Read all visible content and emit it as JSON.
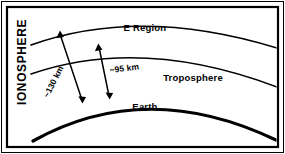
{
  "figure": {
    "background_color": "#ffffff",
    "stroke_color": "#000000",
    "frame": {
      "outer_border_label": "outer-frame",
      "inner_border_label": "inner-frame"
    }
  },
  "labels": {
    "ionosphere": "IONOSPHERE",
    "e_region": "E Region",
    "troposphere": "Troposphere",
    "earth": "Earth"
  },
  "dimensions": {
    "upper": "~130 km",
    "lower": "~95 km"
  },
  "curves": [
    {
      "name": "e-region-top-boundary",
      "thickness": "thin"
    },
    {
      "name": "e-region-bottom-boundary",
      "thickness": "thin"
    },
    {
      "name": "earth-surface",
      "thickness": "thick"
    }
  ],
  "arrows": [
    {
      "name": "height-arrow-130km",
      "style": "double-headed",
      "value": "~130 km"
    },
    {
      "name": "height-arrow-95km",
      "style": "double-headed",
      "value": "~95 km"
    }
  ]
}
